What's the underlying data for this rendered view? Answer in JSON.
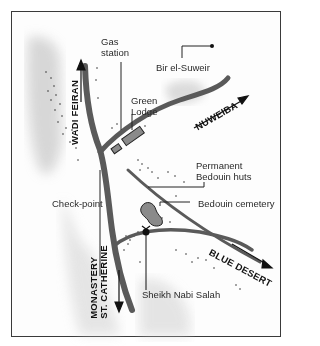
{
  "map": {
    "labels": {
      "gas_station_line1": "Gas",
      "gas_station_line2": "station",
      "bir_el_suweir": "Bir el-Suweir",
      "green_lodge_line1": "Green",
      "green_lodge_line2": "Lodge",
      "wadi_feiran": "WADI FEIRAN",
      "nuweiba": "NUWEIBA",
      "permanent_huts_line1": "Permanent",
      "permanent_huts_line2": "Bedouin huts",
      "bedouin_cemetery": "Bedouin cemetery",
      "check_point": "Check-point",
      "blue_desert": "BLUE DESERT",
      "monastery_line1": "MONASTERY",
      "monastery_line2": "ST. CATHERINE",
      "sheikh_nabi_salah": "Sheikh Nabi Salah"
    },
    "colors": {
      "road": "#5a5a5a",
      "terrain": "#c8c8c8",
      "frame": "#3a3a3a",
      "text": "#2a2a2a"
    }
  }
}
